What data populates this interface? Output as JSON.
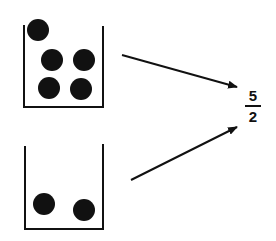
{
  "diagram": {
    "containers": [
      {
        "id": "top",
        "ball_count": 5
      },
      {
        "id": "bottom",
        "ball_count": 2
      }
    ],
    "arrows": [
      {
        "from": "top-container",
        "to": "ratio"
      },
      {
        "from": "bottom-container",
        "to": "ratio"
      }
    ],
    "ratio": {
      "numerator": "5",
      "denominator": "2"
    },
    "colors": {
      "ink": "#111111",
      "background": "#ffffff"
    }
  }
}
